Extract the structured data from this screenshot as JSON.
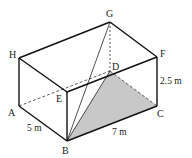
{
  "diagram": {
    "type": "cuboid",
    "colors": {
      "edge": "#111111",
      "hidden": "#333333",
      "shade": "#c8c8c8"
    },
    "vertices": {
      "A": {
        "label": "A",
        "x": 19,
        "y": 106
      },
      "B": {
        "label": "B",
        "x": 67,
        "y": 141
      },
      "C": {
        "label": "C",
        "x": 157,
        "y": 106
      },
      "D": {
        "label": "D",
        "x": 110,
        "y": 71
      },
      "E": {
        "label": "E",
        "x": 67,
        "y": 92
      },
      "F": {
        "label": "F",
        "x": 157,
        "y": 57
      },
      "G": {
        "label": "G",
        "x": 110,
        "y": 22
      },
      "H": {
        "label": "H",
        "x": 19,
        "y": 58
      }
    },
    "dimensions": {
      "AB": "5 m",
      "BC": "7 m",
      "CF": "2.5 m"
    },
    "shaded_region": [
      "B",
      "D",
      "C"
    ],
    "diagonals": [
      "BG",
      "BD"
    ]
  }
}
